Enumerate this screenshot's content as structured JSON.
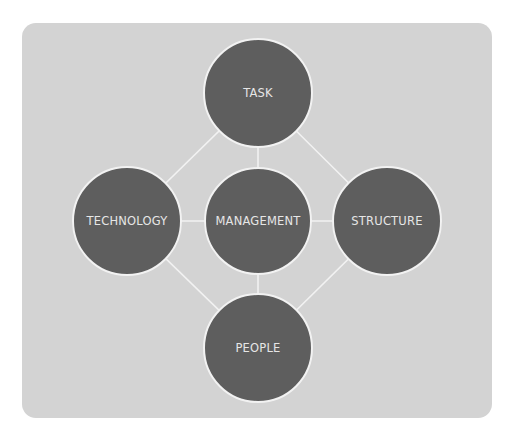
{
  "diagram": {
    "colors": {
      "panel": "#d3d3d3",
      "node_fill": "#5e5e5e",
      "node_border": "#f2f2f2",
      "link": "#f2f2f2",
      "label": "#e6e6e6"
    },
    "nodes": [
      {
        "id": "task",
        "label": "TASK"
      },
      {
        "id": "technology",
        "label": "TECHNOLOGY"
      },
      {
        "id": "management",
        "label": "MANAGEMENT"
      },
      {
        "id": "structure",
        "label": "STRUCTURE"
      },
      {
        "id": "people",
        "label": "PEOPLE"
      }
    ],
    "edges": [
      {
        "from": "task",
        "to": "technology"
      },
      {
        "from": "task",
        "to": "structure"
      },
      {
        "from": "people",
        "to": "technology"
      },
      {
        "from": "people",
        "to": "structure"
      },
      {
        "from": "management",
        "to": "task"
      },
      {
        "from": "management",
        "to": "technology"
      },
      {
        "from": "management",
        "to": "structure"
      },
      {
        "from": "management",
        "to": "people"
      }
    ]
  }
}
